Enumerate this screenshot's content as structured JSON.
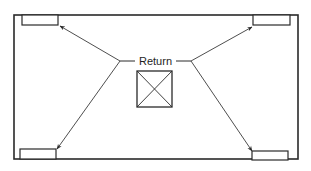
{
  "diagram": {
    "label": "Return",
    "colors": {
      "stroke": "#2a2a2a",
      "background": "#ffffff"
    },
    "room": {
      "x": 14,
      "y": 15,
      "width": 284,
      "height": 144
    },
    "return_grille": {
      "x": 137,
      "y": 71,
      "width": 35,
      "height": 36
    },
    "supply_vents": [
      {
        "id": "top-left",
        "x": 22,
        "y": 15,
        "width": 36,
        "height": 10
      },
      {
        "id": "top-right",
        "x": 253,
        "y": 15,
        "width": 37,
        "height": 10
      },
      {
        "id": "bottom-left",
        "x": 20,
        "y": 149,
        "width": 36,
        "height": 10
      },
      {
        "id": "bottom-right",
        "x": 252,
        "y": 151,
        "width": 36,
        "height": 9
      }
    ],
    "arrows": [
      {
        "from": "left-junction",
        "to": "top-left",
        "x1": 120,
        "y1": 61,
        "x2": 60,
        "y2": 26
      },
      {
        "from": "left-junction",
        "to": "bottom-left",
        "x1": 120,
        "y1": 61,
        "x2": 57,
        "y2": 149
      },
      {
        "from": "right-junction",
        "to": "top-right",
        "x1": 191,
        "y1": 61,
        "x2": 252,
        "y2": 27
      },
      {
        "from": "right-junction",
        "to": "bottom-right",
        "x1": 191,
        "y1": 61,
        "x2": 252,
        "y2": 151
      }
    ]
  }
}
